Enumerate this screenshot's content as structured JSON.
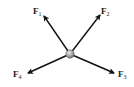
{
  "diagram": {
    "type": "force-diagram",
    "particle": {
      "label": "particle",
      "color": "#a8a8a8",
      "cx": 70,
      "cy": 54,
      "r": 4
    },
    "forces": [
      {
        "id": "F1",
        "main": "F",
        "sub": "1",
        "direction": "up-left",
        "tip": [
          44,
          16
        ],
        "label_pos": [
          33,
          14
        ]
      },
      {
        "id": "F2",
        "main": "F",
        "sub": "2",
        "direction": "up-right",
        "tip": [
          100,
          15
        ],
        "label_pos": [
          101,
          14
        ]
      },
      {
        "id": "F3",
        "main": "F",
        "sub": "3",
        "direction": "down-right",
        "tip": [
          114,
          73
        ],
        "label_pos": [
          118,
          77
        ]
      },
      {
        "id": "F4",
        "main": "F",
        "sub": "4",
        "direction": "down-left",
        "tip": [
          28,
          73
        ],
        "label_pos": [
          13,
          77
        ]
      }
    ],
    "arrow_color": "#111111"
  }
}
